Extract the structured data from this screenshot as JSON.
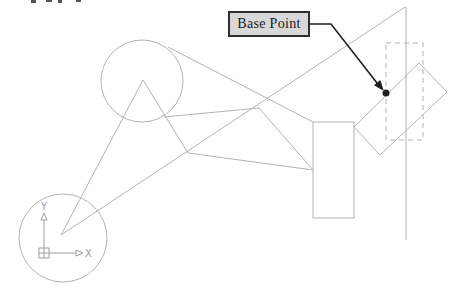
{
  "figure": {
    "canvas": {
      "width": 459,
      "height": 294
    },
    "colors": {
      "background": "#ffffff",
      "line_gray": "#b3b3b3",
      "ucs_gray": "#9e9e9e",
      "ink": "#1f1f1f",
      "callout_fill": "#d8d8d8",
      "callout_border": "#2e2e2e",
      "callout_text": "#1a1a1a",
      "fragment_gray": "#555555"
    },
    "callout": {
      "text": "Base Point",
      "x": 228,
      "y": 11,
      "w": 82,
      "h": 26
    },
    "ucs": {
      "x_label": "X",
      "y_label": "Y",
      "origin_box": {
        "x": 39,
        "y": 248,
        "size": 10
      },
      "x_axis": {
        "x1": 49,
        "y1": 253,
        "x2": 76,
        "y2": 253,
        "head": [
          [
            76,
            250
          ],
          [
            76,
            256
          ],
          [
            83,
            253
          ]
        ],
        "label_x": 85,
        "label_y": 257
      },
      "y_axis": {
        "x1": 44,
        "y1": 248,
        "x2": 44,
        "y2": 220,
        "head": [
          [
            41,
            220
          ],
          [
            47,
            220
          ],
          [
            44,
            213
          ]
        ],
        "label_x": 44,
        "label_y": 210
      }
    },
    "cropped_text_fragments": [
      {
        "x": 31,
        "w": 5,
        "h": 3
      },
      {
        "x": 46,
        "w": 6,
        "h": 2
      },
      {
        "x": 58,
        "w": 4,
        "h": 3
      },
      {
        "x": 76,
        "w": 5,
        "h": 2
      }
    ],
    "geometry": {
      "elements": [
        {
          "name": "large-circle",
          "type": "circle",
          "cx": 142,
          "cy": 81,
          "r": 41
        },
        {
          "name": "small-circle",
          "type": "circle",
          "cx": 63,
          "cy": 238,
          "r": 44
        },
        {
          "name": "triangle-left-leg",
          "type": "line",
          "x1": 143,
          "y1": 80,
          "x2": 61,
          "y2": 235
        },
        {
          "name": "triangle-right-leg",
          "type": "line",
          "x1": 143,
          "y1": 80,
          "x2": 188,
          "y2": 153
        },
        {
          "name": "long-diagonal-line",
          "type": "line",
          "x1": 61,
          "y1": 235,
          "x2": 405,
          "y2": 7
        },
        {
          "name": "vertical-construction-line",
          "type": "line",
          "x1": 406,
          "y1": 7,
          "x2": 406,
          "y2": 240
        },
        {
          "name": "circle-to-rectangle-line",
          "type": "line",
          "x1": 168,
          "y1": 47,
          "x2": 313,
          "y2": 122
        },
        {
          "name": "upper-connector-polyline",
          "type": "polyline",
          "points": [
            [
              164,
              117
            ],
            [
              259,
              108
            ],
            [
              313,
              170
            ]
          ]
        },
        {
          "name": "lower-connector-line",
          "type": "line",
          "x1": 188,
          "y1": 153,
          "x2": 313,
          "y2": 170
        },
        {
          "name": "rectangle",
          "type": "rect",
          "x": 313,
          "y": 122,
          "w": 41,
          "h": 96
        },
        {
          "name": "rotated-rectangle",
          "type": "polygon",
          "points": [
            [
              419,
              63
            ],
            [
              447,
              92
            ],
            [
              380,
              155
            ],
            [
              354,
              127
            ]
          ]
        },
        {
          "name": "dashed-rectangle",
          "type": "rect",
          "x": 386,
          "y": 43,
          "w": 37,
          "h": 97,
          "dashed": true
        },
        {
          "name": "leader-line",
          "type": "polyline",
          "points": [
            [
              310,
              24
            ],
            [
              331,
              24
            ],
            [
              377,
              83
            ]
          ],
          "stroke": "ink",
          "width": 1.6
        },
        {
          "name": "leader-arrowhead",
          "type": "polygon",
          "points": [
            [
              383,
              90
            ],
            [
              374.6,
              85.1
            ],
            [
              380.1,
              80.7
            ]
          ],
          "stroke": "ink",
          "fill": "ink"
        },
        {
          "name": "base-point-dot",
          "type": "dot",
          "cx": 386,
          "cy": 93,
          "r": 3.5,
          "fill": "ink"
        }
      ]
    }
  }
}
